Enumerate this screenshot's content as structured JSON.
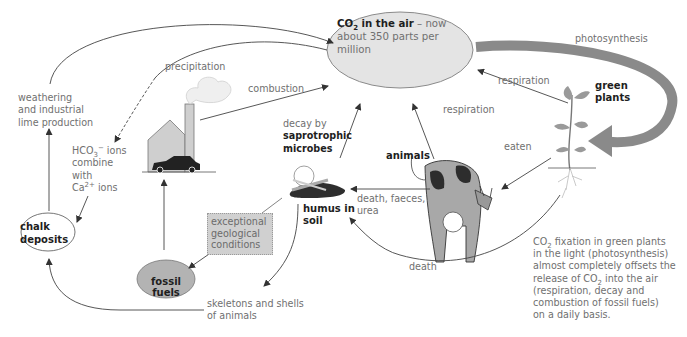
{
  "diagram": {
    "nodes": {
      "co2_air": {
        "bold": "CO",
        "sub": "2",
        "bold_rest": " in the air",
        "text": " – now about 350 parts per million"
      },
      "green_plants": {
        "line1": "green",
        "line2": "plants"
      },
      "animals": {
        "label": "animals"
      },
      "humus": {
        "line1": "humus in",
        "line2": "soil"
      },
      "chalk": {
        "line1": "chalk",
        "line2": "deposits"
      },
      "fossil_fuels": {
        "label": "fossil fuels"
      },
      "geological": {
        "line1": "exceptional",
        "line2": "geological",
        "line3": "conditions"
      }
    },
    "edge_labels": {
      "photosynthesis": "photosynthesis",
      "respiration_plants": "respiration",
      "respiration_animals": "respiration",
      "eaten": "eaten",
      "combustion": "combustion",
      "precipitation": "precipitation",
      "decay_line1": "decay by",
      "decay_line2": "saprotrophic",
      "decay_line3": "microbes",
      "death_faeces_line1": "death, faeces,",
      "death_faeces_line2": "urea",
      "death": "death",
      "weathering_line1": "weathering",
      "weathering_line2": "and industrial",
      "weathering_line3": "lime production",
      "hco3_line1_a": "HCO",
      "hco3_sub": "3",
      "hco3_sup": "−",
      "hco3_line1_b": " ions",
      "hco3_line2": "combine",
      "hco3_line3": "with",
      "hco3_line4_a": "Ca",
      "hco3_line4_sup": "2+",
      "hco3_line4_b": " ions",
      "skeletons_line1": "skeletons and shells",
      "skeletons_line2": "of animals"
    },
    "note": {
      "l1_a": "CO",
      "l1_sub": "2",
      "l1_b": " fixation in green plants",
      "l2": "in the light (photosynthesis)",
      "l3": "almost completely offsets the",
      "l4_a": "release of CO",
      "l4_sub": "2",
      "l4_b": " into the air",
      "l5": "(respiration, decay and",
      "l6": "combustion of fossil fuels)",
      "l7": "on a daily basis."
    },
    "colors": {
      "co2_fill": "#e4e4e4",
      "fossil_fill": "#b3b3b3",
      "geo_fill": "#d0d0d0",
      "arrow": "#555555",
      "photosynthesis_arrow": "#8a8a8a"
    }
  }
}
